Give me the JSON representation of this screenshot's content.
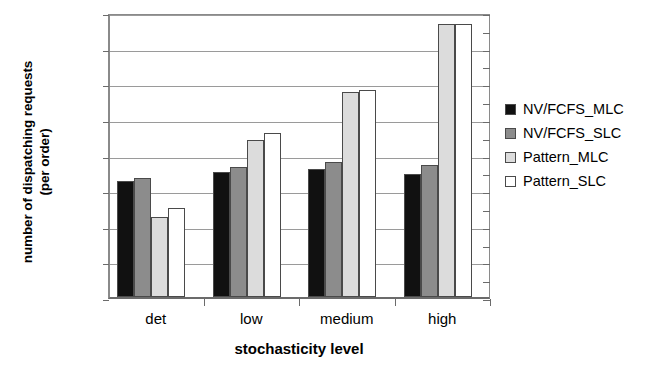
{
  "chart_data": {
    "type": "bar",
    "title": "",
    "xlabel": "stochasticity level",
    "ylabel": "number of dispatching requests (per order)",
    "ylabel_line1": "number of dispatching requests",
    "ylabel_line2": "(per order)",
    "categories": [
      "det",
      "low",
      "medium",
      "high"
    ],
    "series": [
      {
        "name": "NV/FCFS_MLC",
        "color": "#111111",
        "values": [
          1.65,
          1.7,
          1.72,
          1.69
        ]
      },
      {
        "name": "NV/FCFS_SLC",
        "color": "#8c8c8c",
        "values": [
          1.67,
          1.73,
          1.76,
          1.74
        ]
      },
      {
        "name": "Pattern_MLC",
        "color": "#dcdcdc",
        "values": [
          1.45,
          1.88,
          2.15,
          2.53
        ]
      },
      {
        "name": "Pattern_SLC",
        "color": "#ffffff",
        "values": [
          1.5,
          1.92,
          2.16,
          2.53
        ]
      }
    ],
    "ylim": [
      1,
      2.6
    ],
    "ytick_values": [
      1,
      1.2,
      1.4,
      1.6,
      1.8,
      2,
      2.2,
      2.4,
      2.6
    ],
    "ytick_labels": [
      "1",
      "1,2",
      "1,4",
      "1,6",
      "1,8",
      "2",
      "2,2",
      "2,4",
      "2,6"
    ],
    "grid": true,
    "legend_position": "right",
    "decimal_separator": ","
  }
}
